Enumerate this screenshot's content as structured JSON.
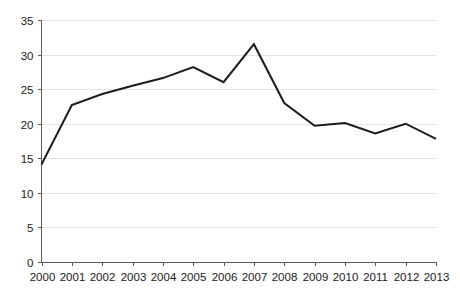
{
  "chart_data": {
    "type": "line",
    "title": "",
    "subtitle": "",
    "xlabel": "",
    "ylabel": "",
    "categories": [
      "2000",
      "2001",
      "2002",
      "2003",
      "2004",
      "2005",
      "2006",
      "2007",
      "2008",
      "2009",
      "2010",
      "2011",
      "2012",
      "2013"
    ],
    "x": [
      2000,
      2001,
      2002,
      2003,
      2004,
      2005,
      2006,
      2007,
      2008,
      2009,
      2010,
      2011,
      2012,
      2013
    ],
    "values": [
      14.1,
      22.7,
      24.3,
      25.5,
      26.6,
      28.2,
      26.0,
      31.5,
      23.0,
      19.7,
      20.1,
      18.6,
      20.0,
      17.8
    ],
    "series": [
      {
        "name": "",
        "color": "#1c1c1c",
        "values": [
          14.1,
          22.7,
          24.3,
          25.5,
          26.6,
          28.2,
          26.0,
          31.5,
          23.0,
          19.7,
          20.1,
          18.6,
          20.0,
          17.8
        ]
      }
    ],
    "ylim": [
      0,
      35
    ],
    "xlim": [
      2000,
      2013
    ],
    "yticks": [
      0,
      5,
      10,
      15,
      20,
      25,
      30,
      35
    ],
    "ytick_labels": [
      "0",
      "5",
      "10",
      "15",
      "20",
      "25",
      "30",
      "35"
    ],
    "xtick_labels": [
      "2000",
      "2001",
      "2002",
      "2003",
      "2004",
      "2005",
      "2006",
      "2007",
      "2008",
      "2009",
      "2010",
      "2011",
      "2012",
      "2013"
    ],
    "grid": true,
    "grid_axis": "y",
    "grid_color": "#e3e3e3",
    "legend": false,
    "legend_position": "none",
    "axis_color": "#5a5a5a",
    "line_color": "#1c1c1c",
    "background_color": "#ffffff",
    "markers": false,
    "annotations": []
  }
}
